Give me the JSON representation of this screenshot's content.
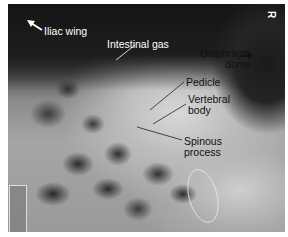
{
  "image": {
    "type": "radiograph",
    "description": "Abdominal X-ray with anatomical labels",
    "orientation_marker": "R"
  },
  "labels": [
    {
      "id": "iliac-wing",
      "text": "Iliac wing",
      "color": "#ffffff"
    },
    {
      "id": "intestinal-gas",
      "text": "Intestinal gas",
      "color": "#ffffff"
    },
    {
      "id": "diaphragm-dome",
      "text": "Diaphragm dome",
      "line1": "Diaphragm",
      "line2": "dome",
      "color": "#111111"
    },
    {
      "id": "pedicle",
      "text": "Pedicle",
      "color": "#111111"
    },
    {
      "id": "vertebral-body",
      "text": "Vertebral body",
      "line1": "Vertebral",
      "line2": "body",
      "color": "#111111"
    },
    {
      "id": "spinous-process",
      "text": "Spinous process",
      "line1": "Spinous",
      "line2": "process",
      "color": "#111111"
    }
  ]
}
